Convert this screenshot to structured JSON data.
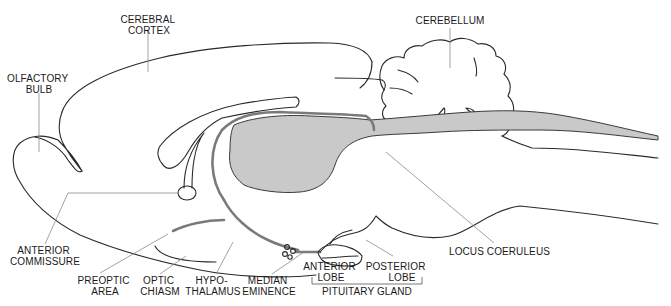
{
  "figure": {
    "type": "sagittal brain section diagram",
    "colors": {
      "outline": "#2a2a2a",
      "shaded_region": "#c9c9c9",
      "fiber_tract": "#7a7a7a",
      "leader_line": "#8a8a8a",
      "background": "#ffffff"
    },
    "labels": {
      "cerebral_cortex": [
        "CEREBRAL",
        "CORTEX"
      ],
      "cerebellum": [
        "CEREBELLUM"
      ],
      "olfactory_bulb": [
        "OLFACTORY",
        "BULB"
      ],
      "anterior_commissure": [
        "ANTERIOR",
        "COMMISSURE"
      ],
      "preoptic_area": [
        "PREOPTIC",
        "AREA"
      ],
      "optic_chiasm": [
        "OPTIC",
        "CHIASM"
      ],
      "hypothalamus": [
        "HYPO-",
        "THALAMUS"
      ],
      "median_eminence": [
        "MEDIAN",
        "EMINENCE"
      ],
      "anterior_lobe": [
        "ANTERIOR",
        "LOBE"
      ],
      "posterior_lobe": [
        "POSTERIOR",
        "LOBE"
      ],
      "pituitary_gland": [
        "PITUITARY GLAND"
      ],
      "locus_coeruleus": [
        "LOCUS COERULEUS"
      ]
    }
  }
}
